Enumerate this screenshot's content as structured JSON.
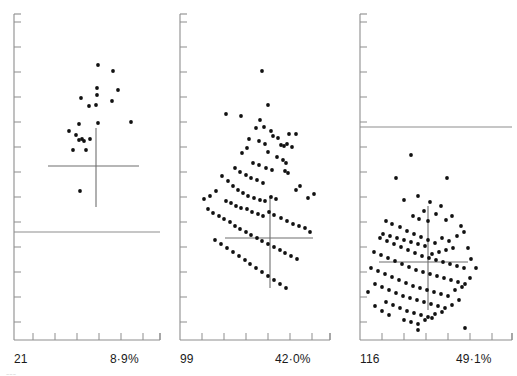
{
  "figure": {
    "type": "scatter-panels",
    "background": "#ffffff",
    "axis_color": "#8d8d8d",
    "point_color": "#111111",
    "crosshair_color": "#6f6f6f",
    "reference_line_color": "#8d8d8d",
    "label_color": "#1a1a1a",
    "width": 517,
    "height": 376,
    "faint_artifact": "---"
  },
  "chart_data": {
    "type": "scatter",
    "title": "",
    "xlabel": "",
    "ylabel": "",
    "grid": false,
    "legend": null,
    "panels": [
      {
        "id": "panel-1",
        "count_label": "21",
        "percent_label": "8·9%",
        "count": 21,
        "percent": 8.9,
        "axis": {
          "x_origin": 14,
          "y_top": 14,
          "y_bottom": 340,
          "x_right": 160,
          "x_ticks": [
            33,
            55,
            77,
            99,
            121,
            143,
            160
          ],
          "y_ticks": [
            22,
            47,
            72,
            97,
            122,
            147,
            172,
            197,
            222,
            247,
            272,
            297,
            322
          ]
        },
        "reference_line": {
          "y": 232,
          "x1": 14,
          "x2": 160
        },
        "crosshair": {
          "cx": 96,
          "cy": 166,
          "x1": 48,
          "x2": 139,
          "y1": 128,
          "y2": 207
        },
        "points": [
          [
            98,
            65
          ],
          [
            113,
            71
          ],
          [
            97,
            88
          ],
          [
            97,
            95
          ],
          [
            118,
            90
          ],
          [
            81,
            98
          ],
          [
            112,
            101
          ],
          [
            89,
            106
          ],
          [
            96,
            105
          ],
          [
            98,
            123
          ],
          [
            79,
            124
          ],
          [
            131,
            122
          ],
          [
            69,
            131
          ],
          [
            76,
            135
          ],
          [
            82,
            139
          ],
          [
            84,
            141
          ],
          [
            79,
            140
          ],
          [
            73,
            150
          ],
          [
            86,
            150
          ],
          [
            80,
            191
          ],
          [
            90,
            139
          ]
        ]
      },
      {
        "id": "panel-2",
        "count_label": "99",
        "percent_label": "42·0%",
        "count": 99,
        "percent": 42.0,
        "axis": {
          "x_origin": 180,
          "y_top": 14,
          "y_bottom": 340,
          "x_right": 330,
          "x_ticks": [
            202,
            224,
            246,
            268,
            290,
            312,
            330
          ],
          "y_ticks": [
            22,
            47,
            72,
            97,
            122,
            147,
            172,
            197,
            222,
            247,
            272,
            297,
            322
          ]
        },
        "reference_line": null,
        "crosshair": {
          "cx": 270,
          "cy": 238,
          "x1": 225,
          "x2": 313,
          "y1": 196,
          "y2": 288
        },
        "points": [
          [
            262,
            71
          ],
          [
            268,
            105
          ],
          [
            226,
            114
          ],
          [
            241,
            116
          ],
          [
            260,
            120
          ],
          [
            256,
            128
          ],
          [
            264,
            127
          ],
          [
            271,
            131
          ],
          [
            249,
            139
          ],
          [
            259,
            141
          ],
          [
            273,
            136
          ],
          [
            278,
            138
          ],
          [
            289,
            134
          ],
          [
            296,
            134
          ],
          [
            265,
            144
          ],
          [
            281,
            145
          ],
          [
            284,
            146
          ],
          [
            287,
            144
          ],
          [
            292,
            147
          ],
          [
            247,
            148
          ],
          [
            242,
            153
          ],
          [
            268,
            152
          ],
          [
            277,
            157
          ],
          [
            283,
            160
          ],
          [
            286,
            163
          ],
          [
            253,
            163
          ],
          [
            259,
            165
          ],
          [
            266,
            168
          ],
          [
            272,
            170
          ],
          [
            285,
            171
          ],
          [
            288,
            173
          ],
          [
            235,
            168
          ],
          [
            240,
            172
          ],
          [
            246,
            175
          ],
          [
            251,
            178
          ],
          [
            257,
            180
          ],
          [
            263,
            183
          ],
          [
            222,
            176
          ],
          [
            228,
            181
          ],
          [
            233,
            186
          ],
          [
            238,
            190
          ],
          [
            243,
            193
          ],
          [
            248,
            196
          ],
          [
            254,
            198
          ],
          [
            260,
            200
          ],
          [
            265,
            201
          ],
          [
            271,
            197
          ],
          [
            276,
            199
          ],
          [
            296,
            190
          ],
          [
            300,
            186
          ],
          [
            308,
            198
          ],
          [
            314,
            194
          ],
          [
            216,
            191
          ],
          [
            210,
            196
          ],
          [
            204,
            199
          ],
          [
            226,
            201
          ],
          [
            231,
            203
          ],
          [
            236,
            206
          ],
          [
            241,
            208
          ],
          [
            247,
            209
          ],
          [
            252,
            212
          ],
          [
            258,
            214
          ],
          [
            263,
            216
          ],
          [
            269,
            212
          ],
          [
            274,
            215
          ],
          [
            281,
            218
          ],
          [
            287,
            221
          ],
          [
            293,
            224
          ],
          [
            299,
            226
          ],
          [
            305,
            228
          ],
          [
            310,
            232
          ],
          [
            208,
            209
          ],
          [
            213,
            213
          ],
          [
            219,
            216
          ],
          [
            224,
            219
          ],
          [
            230,
            222
          ],
          [
            235,
            226
          ],
          [
            240,
            229
          ],
          [
            246,
            232
          ],
          [
            251,
            235
          ],
          [
            257,
            238
          ],
          [
            262,
            241
          ],
          [
            268,
            244
          ],
          [
            274,
            247
          ],
          [
            280,
            250
          ],
          [
            285,
            253
          ],
          [
            291,
            256
          ],
          [
            297,
            259
          ],
          [
            215,
            240
          ],
          [
            221,
            244
          ],
          [
            227,
            248
          ],
          [
            233,
            252
          ],
          [
            239,
            256
          ],
          [
            245,
            260
          ],
          [
            250,
            264
          ],
          [
            256,
            268
          ],
          [
            262,
            272
          ],
          [
            268,
            276
          ],
          [
            274,
            280
          ],
          [
            280,
            284
          ],
          [
            286,
            288
          ]
        ]
      },
      {
        "id": "panel-3",
        "count_label": "116",
        "percent_label": "49·1%",
        "count": 116,
        "percent": 49.1,
        "axis": {
          "x_origin": 360,
          "y_top": 14,
          "y_bottom": 340,
          "x_right": 512,
          "x_ticks": [
            382,
            404,
            426,
            448,
            470,
            492,
            512
          ],
          "y_ticks": [
            22,
            47,
            72,
            97,
            122,
            147,
            172,
            197,
            222,
            247,
            272,
            297,
            322
          ]
        },
        "reference_line": {
          "y": 127,
          "x1": 360,
          "x2": 512
        },
        "crosshair": {
          "cx": 428,
          "cy": 262,
          "x1": 379,
          "x2": 468,
          "y1": 206,
          "y2": 310
        },
        "points": [
          [
            411,
            155
          ],
          [
            396,
            178
          ],
          [
            447,
            178
          ],
          [
            418,
            196
          ],
          [
            404,
            200
          ],
          [
            430,
            202
          ],
          [
            424,
            211
          ],
          [
            436,
            214
          ],
          [
            441,
            206
          ],
          [
            413,
            216
          ],
          [
            419,
            219
          ],
          [
            428,
            221
          ],
          [
            446,
            220
          ],
          [
            452,
            216
          ],
          [
            386,
            221
          ],
          [
            392,
            224
          ],
          [
            400,
            227
          ],
          [
            407,
            231
          ],
          [
            414,
            234
          ],
          [
            421,
            237
          ],
          [
            428,
            240
          ],
          [
            435,
            243
          ],
          [
            442,
            238
          ],
          [
            449,
            241
          ],
          [
            457,
            236
          ],
          [
            464,
            232
          ],
          [
            380,
            238
          ],
          [
            387,
            241
          ],
          [
            394,
            244
          ],
          [
            401,
            247
          ],
          [
            408,
            250
          ],
          [
            415,
            253
          ],
          [
            422,
            256
          ],
          [
            429,
            258
          ],
          [
            436,
            260
          ],
          [
            443,
            262
          ],
          [
            450,
            264
          ],
          [
            457,
            266
          ],
          [
            464,
            268
          ],
          [
            471,
            259
          ],
          [
            374,
            252
          ],
          [
            381,
            255
          ],
          [
            388,
            258
          ],
          [
            395,
            261
          ],
          [
            402,
            264
          ],
          [
            409,
            267
          ],
          [
            416,
            270
          ],
          [
            423,
            272
          ],
          [
            430,
            274
          ],
          [
            437,
            276
          ],
          [
            444,
            278
          ],
          [
            451,
            280
          ],
          [
            458,
            282
          ],
          [
            465,
            284
          ],
          [
            371,
            268
          ],
          [
            378,
            271
          ],
          [
            385,
            274
          ],
          [
            392,
            277
          ],
          [
            399,
            280
          ],
          [
            406,
            283
          ],
          [
            413,
            286
          ],
          [
            420,
            288
          ],
          [
            427,
            290
          ],
          [
            434,
            292
          ],
          [
            441,
            294
          ],
          [
            448,
            296
          ],
          [
            455,
            290
          ],
          [
            462,
            287
          ],
          [
            375,
            284
          ],
          [
            382,
            287
          ],
          [
            389,
            290
          ],
          [
            396,
            293
          ],
          [
            403,
            296
          ],
          [
            410,
            298
          ],
          [
            417,
            300
          ],
          [
            424,
            302
          ],
          [
            431,
            304
          ],
          [
            438,
            306
          ],
          [
            445,
            308
          ],
          [
            452,
            305
          ],
          [
            368,
            292
          ],
          [
            386,
            302
          ],
          [
            393,
            305
          ],
          [
            400,
            308
          ],
          [
            407,
            311
          ],
          [
            414,
            313
          ],
          [
            421,
            315
          ],
          [
            428,
            317
          ],
          [
            435,
            314
          ],
          [
            442,
            312
          ],
          [
            404,
            320
          ],
          [
            411,
            322
          ],
          [
            418,
            324
          ],
          [
            425,
            320
          ],
          [
            432,
            318
          ],
          [
            389,
            315
          ],
          [
            382,
            311
          ],
          [
            375,
            306
          ],
          [
            465,
            328
          ],
          [
            459,
            300
          ],
          [
            470,
            278
          ],
          [
            476,
            268
          ],
          [
            468,
            248
          ],
          [
            461,
            226
          ],
          [
            453,
            248
          ],
          [
            446,
            250
          ],
          [
            439,
            252
          ],
          [
            432,
            254
          ],
          [
            425,
            246
          ],
          [
            418,
            244
          ],
          [
            411,
            242
          ],
          [
            404,
            240
          ],
          [
            397,
            238
          ],
          [
            390,
            236
          ],
          [
            383,
            234
          ],
          [
            418,
            330
          ]
        ]
      }
    ]
  }
}
